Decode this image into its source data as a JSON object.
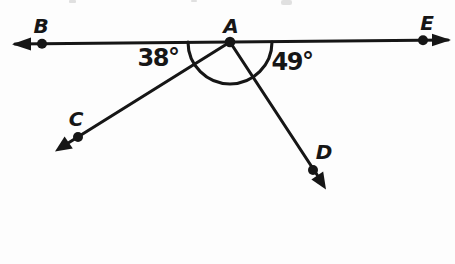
{
  "figure": {
    "type": "geometry-angle-diagram",
    "background_color": "#fdfdfd",
    "ink_color": "#161616",
    "labels": {
      "B": "B",
      "A": "A",
      "E": "E",
      "C": "C",
      "D": "D",
      "angle_BAC": "38°",
      "angle_DAE": "49°"
    },
    "structure": {
      "line": "Horizontal straight line through B, A, E with arrowheads on both ends",
      "rays": [
        "Ray from vertex A down-left through point C, arrowhead at end",
        "Ray from vertex A down-right through point D, arrowhead at end"
      ],
      "arc": "Semicircular arc centered at vertex A spanning below line BE, crossing rays AC and AD",
      "points_marked_with_dots": [
        "B",
        "A",
        "E",
        "C",
        "D"
      ],
      "angles": [
        {
          "vertex": "A",
          "between": [
            "ray AB",
            "ray AC"
          ],
          "value_degrees": 38,
          "label": "38°"
        },
        {
          "vertex": "A",
          "between": [
            "ray AD",
            "ray AE"
          ],
          "value_degrees": 49,
          "label": "49°"
        }
      ]
    }
  }
}
